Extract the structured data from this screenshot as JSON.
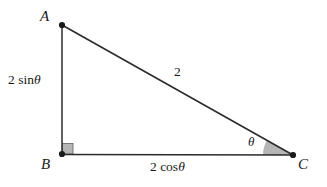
{
  "figure": {
    "type": "right-triangle",
    "background_color": "#ffffff",
    "stroke_color": "#2b2b2b",
    "fill_gray": "#b5b5b5",
    "vertices": [
      {
        "name": "A",
        "label": "A",
        "x": 62,
        "y": 25
      },
      {
        "name": "B",
        "label": "B",
        "x": 62,
        "y": 154
      },
      {
        "name": "C",
        "label": "C",
        "x": 293,
        "y": 155
      }
    ],
    "sides": [
      {
        "name": "AB",
        "label": "2 sin θ",
        "label_prefix": "2 sin",
        "label_symbol": "θ"
      },
      {
        "name": "BC",
        "label": "2 cos θ",
        "label_prefix": "2 cos",
        "label_symbol": "θ"
      },
      {
        "name": "AC",
        "label": "2",
        "label_prefix": "2",
        "label_symbol": ""
      }
    ],
    "angles": [
      {
        "at": "B",
        "type": "right-angle",
        "marker": "square",
        "filled": true,
        "label": ""
      },
      {
        "at": "C",
        "type": "acute",
        "marker": "sector",
        "filled": true,
        "label": "θ",
        "degrees": 29
      }
    ]
  }
}
